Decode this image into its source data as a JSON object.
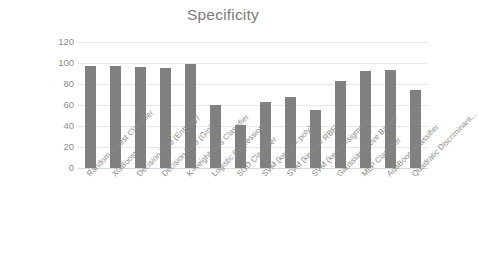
{
  "chart_data": {
    "type": "bar",
    "title": "Specificity",
    "xlabel": "",
    "ylabel": "",
    "ylim": [
      0,
      120
    ],
    "yticks": [
      0,
      20,
      40,
      60,
      80,
      100,
      120
    ],
    "grid": true,
    "legend": null,
    "bar_color": "#808080",
    "categories": [
      "Random Forest Classifier",
      "XGBoost",
      "Decision Tree (Entropy)",
      "Decision Tree (Gini)",
      "K-Neighbours Classifier",
      "Logistic Regression",
      "SGD Classifier",
      "SVM (kernel= poly)",
      "SVM  (kernel= RBF)",
      "SVM (kernel=sigmoid)",
      "Gaussian Naive Bayes",
      "MLP Classifier",
      "AdaBoost Classifier",
      "Quadratic Discriminant..."
    ],
    "values": [
      97,
      97,
      96,
      95,
      99,
      60,
      41,
      63,
      68,
      55,
      83,
      92,
      93,
      74
    ]
  }
}
